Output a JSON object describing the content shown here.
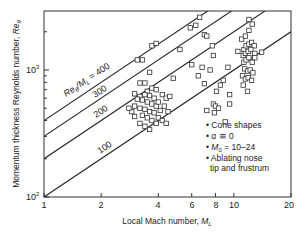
{
  "chart_data": {
    "type": "scatter",
    "title": "",
    "xlabel": "Local Mach number, M_L",
    "ylabel": "Momentum thickness Reynolds number, Re_θ",
    "xscale": "log",
    "yscale": "log",
    "xlim": [
      1,
      20
    ],
    "ylim": [
      100,
      2900
    ],
    "x_ticks": [
      1,
      2,
      4,
      6,
      8,
      10,
      20
    ],
    "x_tick_labels": [
      "1",
      "2",
      "4",
      "6",
      "8",
      "10",
      "20"
    ],
    "y_ticks": [
      100,
      1000
    ],
    "y_tick_labels": [
      "10²",
      "10³"
    ],
    "grid": false,
    "reference_lines": [
      {
        "label": "Re_θ/M_L = 400",
        "ratio": 400
      },
      {
        "label": "300",
        "ratio": 300
      },
      {
        "label": "200",
        "ratio": 200
      },
      {
        "label": "100",
        "ratio": 100
      }
    ],
    "legend": {
      "position": "lower right",
      "entries": [
        "Cone shapes",
        "α ≅ 0",
        "M_0 = 10–24",
        "Ablating nose tip and frustrum"
      ]
    },
    "series": [
      {
        "name": "Data",
        "marker": "open-square",
        "points": [
          [
            3.1,
            1200
          ],
          [
            3.3,
            1200
          ],
          [
            3.7,
            1550
          ],
          [
            3.9,
            1620
          ],
          [
            3.6,
            960
          ],
          [
            3.2,
            790
          ],
          [
            3.4,
            790
          ],
          [
            3.7,
            720
          ],
          [
            3.9,
            700
          ],
          [
            3.5,
            680
          ],
          [
            3.0,
            650
          ],
          [
            3.2,
            620
          ],
          [
            3.4,
            640
          ],
          [
            3.6,
            630
          ],
          [
            3.8,
            600
          ],
          [
            3.1,
            590
          ],
          [
            3.3,
            580
          ],
          [
            3.5,
            560
          ],
          [
            3.7,
            540
          ],
          [
            3.9,
            520
          ],
          [
            3.0,
            520
          ],
          [
            3.2,
            500
          ],
          [
            3.4,
            490
          ],
          [
            3.6,
            470
          ],
          [
            3.8,
            460
          ],
          [
            3.3,
            440
          ],
          [
            3.5,
            420
          ],
          [
            3.7,
            400
          ],
          [
            3.9,
            380
          ],
          [
            3.2,
            380
          ],
          [
            3.4,
            360
          ],
          [
            3.6,
            340
          ],
          [
            2.9,
            470
          ],
          [
            2.8,
            500
          ],
          [
            3.0,
            430
          ],
          [
            4.2,
            640
          ],
          [
            4.4,
            600
          ],
          [
            4.6,
            620
          ],
          [
            4.0,
            560
          ],
          [
            4.3,
            520
          ],
          [
            4.1,
            480
          ],
          [
            4.5,
            470
          ],
          [
            4.0,
            420
          ],
          [
            4.2,
            400
          ],
          [
            4.4,
            380
          ],
          [
            4.8,
            860
          ],
          [
            5.2,
            1450
          ],
          [
            5.9,
            2150
          ],
          [
            6.3,
            2250
          ],
          [
            6.6,
            2600
          ],
          [
            6.8,
            1050
          ],
          [
            7.0,
            1900
          ],
          [
            7.2,
            1850
          ],
          [
            7.7,
            1550
          ],
          [
            7.8,
            1300
          ],
          [
            6.0,
            1100
          ],
          [
            6.5,
            900
          ],
          [
            7.5,
            1000
          ],
          [
            7.0,
            780
          ],
          [
            8.1,
            680
          ],
          [
            8.5,
            760
          ],
          [
            8.8,
            830
          ],
          [
            9.3,
            1050
          ],
          [
            7.8,
            540
          ],
          [
            8.0,
            520
          ],
          [
            8.3,
            500
          ],
          [
            7.2,
            480
          ],
          [
            7.9,
            460
          ],
          [
            9.5,
            540
          ],
          [
            9.0,
            390
          ],
          [
            11.0,
            1750
          ],
          [
            11.5,
            1850
          ],
          [
            12.0,
            2050
          ],
          [
            12.5,
            2300
          ],
          [
            12.0,
            2500
          ],
          [
            11.3,
            1450
          ],
          [
            11.6,
            1550
          ],
          [
            12.0,
            1600
          ],
          [
            12.4,
            1650
          ],
          [
            12.8,
            1550
          ],
          [
            11.2,
            1300
          ],
          [
            11.5,
            1350
          ],
          [
            11.9,
            1400
          ],
          [
            12.3,
            1450
          ],
          [
            12.9,
            1350
          ],
          [
            11.3,
            1150
          ],
          [
            11.6,
            1200
          ],
          [
            12.0,
            1250
          ],
          [
            12.5,
            1150
          ],
          [
            12.9,
            1250
          ],
          [
            11.4,
            1020
          ],
          [
            11.8,
            980
          ],
          [
            12.2,
            1000
          ],
          [
            12.6,
            950
          ],
          [
            11.1,
            900
          ],
          [
            11.5,
            850
          ],
          [
            11.9,
            870
          ],
          [
            12.4,
            830
          ],
          [
            11.2,
            760
          ],
          [
            11.8,
            680
          ],
          [
            14.0,
            1380
          ],
          [
            10.5,
            1400
          ],
          [
            9.5,
            640
          ]
        ]
      }
    ]
  },
  "figure": {
    "x_axis_label": "Local Mach number, ",
    "x_axis_label_sym": "M",
    "x_axis_label_sub": "L",
    "y_axis_label": "Momentum thickness Reynolds number, ",
    "y_axis_label_sym": "Re",
    "y_axis_label_sub": "θ",
    "line_label_400_prefix": "Re",
    "line_label_400_sub1": "θ",
    "line_label_400_mid": "/M",
    "line_label_400_sub2": "L",
    "line_label_400_suffix": " = 400",
    "line_label_300": "300",
    "line_label_200": "200",
    "line_label_100": "100",
    "legend_line1": "• Cone shapes",
    "legend_line2": "• α ≅ 0",
    "legend_line3_pre": "• ",
    "legend_line3_sym": "M",
    "legend_line3_sub": "0",
    "legend_line3_post": " = 10–24",
    "legend_line4": "• Ablating nose",
    "legend_line5": "tip and frustrum",
    "y_tick_100_base": "10",
    "y_tick_100_exp": "2",
    "y_tick_1000_base": "10",
    "y_tick_1000_exp": "3",
    "x_tick_1": "1",
    "x_tick_2": "2",
    "x_tick_4": "4",
    "x_tick_6": "6",
    "x_tick_8": "8",
    "x_tick_10": "10",
    "x_tick_20": "20"
  }
}
